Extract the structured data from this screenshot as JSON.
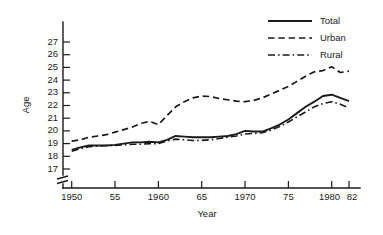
{
  "chart_data": {
    "type": "line",
    "title": "",
    "xlabel": "Year",
    "ylabel": "Age",
    "xlim": [
      1949,
      1982
    ],
    "ylim": [
      16.4,
      27.6
    ],
    "grid": false,
    "legend_position": "top-right",
    "axis_break": "y-axis below 17",
    "ytick_labels": [
      "27",
      "26",
      "25",
      "24",
      "23",
      "22",
      "21",
      "20",
      "19",
      "18",
      "17"
    ],
    "ytick_values": [
      27,
      26,
      25,
      24,
      23,
      22,
      21,
      20,
      19,
      18,
      17
    ],
    "xtick_labels": [
      "1950",
      "55",
      "1960",
      "65",
      "1970",
      "75",
      "1980",
      "82"
    ],
    "xtick_values": [
      1950,
      1955,
      1960,
      1965,
      1970,
      1975,
      1980,
      1982
    ],
    "x": [
      1950,
      1951,
      1952,
      1953,
      1954,
      1955,
      1956,
      1957,
      1958,
      1959,
      1960,
      1961,
      1962,
      1963,
      1964,
      1965,
      1966,
      1967,
      1968,
      1969,
      1970,
      1971,
      1972,
      1973,
      1974,
      1975,
      1976,
      1977,
      1978,
      1979,
      1980,
      1981,
      1982
    ],
    "series": [
      {
        "name": "Total",
        "style": "solid",
        "values": [
          18.5,
          18.7,
          18.85,
          18.85,
          18.85,
          18.9,
          19.0,
          19.1,
          19.1,
          19.15,
          19.1,
          19.3,
          19.6,
          19.55,
          19.5,
          19.5,
          19.5,
          19.55,
          19.6,
          19.75,
          20.0,
          19.95,
          19.95,
          20.2,
          20.5,
          20.9,
          21.4,
          21.9,
          22.3,
          22.75,
          22.85,
          22.6,
          22.35
        ]
      },
      {
        "name": "Urban",
        "style": "dashed",
        "values": [
          19.2,
          19.3,
          19.5,
          19.6,
          19.7,
          19.9,
          20.1,
          20.3,
          20.6,
          20.75,
          20.5,
          21.2,
          21.9,
          22.3,
          22.6,
          22.75,
          22.7,
          22.55,
          22.45,
          22.35,
          22.3,
          22.4,
          22.6,
          22.9,
          23.2,
          23.5,
          23.9,
          24.3,
          24.65,
          24.75,
          25.05,
          24.6,
          24.7
        ]
      },
      {
        "name": "Rural",
        "style": "dash-dot",
        "values": [
          18.4,
          18.6,
          18.75,
          18.8,
          18.85,
          18.85,
          18.9,
          18.95,
          18.95,
          19.0,
          19.0,
          19.2,
          19.35,
          19.3,
          19.25,
          19.25,
          19.3,
          19.4,
          19.5,
          19.6,
          19.75,
          19.8,
          19.85,
          20.05,
          20.35,
          20.7,
          21.1,
          21.5,
          21.9,
          22.15,
          22.3,
          22.1,
          21.8
        ]
      }
    ]
  },
  "legend": {
    "items": [
      {
        "label": "Total"
      },
      {
        "label": "Urban"
      },
      {
        "label": "Rural"
      }
    ]
  },
  "axes": {
    "y_title": "Age",
    "x_title": "Year"
  }
}
